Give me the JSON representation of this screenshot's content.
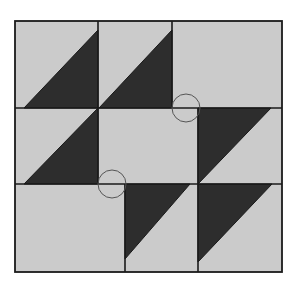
{
  "diagram": {
    "title": "",
    "colors": {
      "background": "#ffffff",
      "light": "#cbcbcb",
      "dark": "#2d2d2d",
      "line": "#1a1a1a",
      "circle": "#555555"
    },
    "frame": {
      "x": 15,
      "y": 21,
      "width": 267,
      "height": 251
    },
    "rows": [
      {
        "y1": 21,
        "y2": 108,
        "dividers_x": [
          98,
          172
        ]
      },
      {
        "y1": 108,
        "y2": 184,
        "dividers_x": [
          98,
          198
        ]
      },
      {
        "y1": 184,
        "y2": 272,
        "dividers_x": [
          125,
          198
        ]
      }
    ],
    "dark_pieces": [
      {
        "id": "r1-t1",
        "points": "24,108 98,30 98,108"
      },
      {
        "id": "r1-t2",
        "points": "99,108 172,30 172,108"
      },
      {
        "id": "r2-t1",
        "points": "24,184 98,108 98,184"
      },
      {
        "id": "r2-t3",
        "points": "198,108 271,108 198,184"
      },
      {
        "id": "r3-t2",
        "points": "125,184 190,184 125,259"
      },
      {
        "id": "r3-t3",
        "points": "198,184 272,184 198,262"
      }
    ],
    "markers": [
      {
        "id": "circle-top",
        "cx": 186,
        "cy": 108,
        "r": 14
      },
      {
        "id": "circle-bottom",
        "cx": 112,
        "cy": 184,
        "r": 14
      }
    ]
  }
}
